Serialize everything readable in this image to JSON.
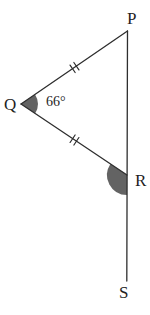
{
  "diagram": {
    "type": "geometry-triangle-figure",
    "labels": {
      "p": "P",
      "q": "Q",
      "r": "R",
      "s": "S"
    },
    "angle_q_value": "66°",
    "marked_angles": [
      {
        "vertex": "Q",
        "value": "66°",
        "style": "shaded-sector"
      },
      {
        "vertex": "R",
        "value": "",
        "style": "shaded-sector-exterior"
      }
    ],
    "equal_sides": {
      "sides": [
        "QP",
        "QR"
      ],
      "tick_count": 2
    },
    "straight_line_through": [
      "P",
      "R",
      "S"
    ],
    "colors": {
      "line": "#2e2e2e",
      "angle_fill": "#636363",
      "text": "#1f1f1f",
      "background": "#ffffff"
    }
  }
}
